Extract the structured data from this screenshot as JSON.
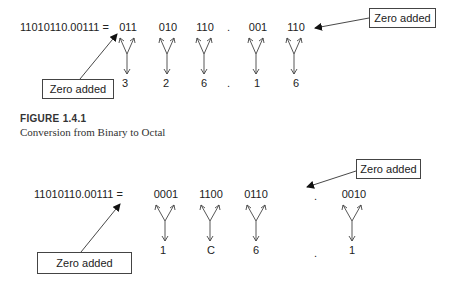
{
  "figure1": {
    "equation": "11010110.00111 =",
    "groups": [
      "011",
      "010",
      "110",
      "001",
      "110"
    ],
    "results": [
      "3",
      "2",
      "6",
      "1",
      "6"
    ],
    "dot": ".",
    "callout_left": "Zero added",
    "callout_right": "Zero added",
    "label": "FIGURE 1.4.1",
    "caption": "Conversion from Binary to Octal"
  },
  "figure2": {
    "equation": "11010110.00111 =",
    "groups": [
      "0001",
      "1100",
      "0110",
      "0010"
    ],
    "results": [
      "1",
      "C",
      "6",
      "1"
    ],
    "dot": ".",
    "callout_left": "Zero added",
    "callout_right": "Zero added"
  }
}
